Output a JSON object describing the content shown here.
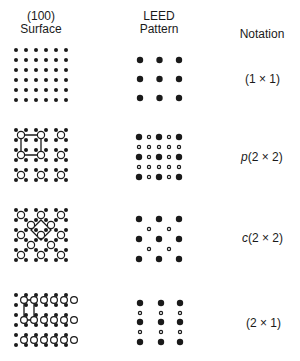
{
  "headers": {
    "surface": {
      "line1": "(100)",
      "line2": "Surface"
    },
    "leed": {
      "line1": "LEED",
      "line2": "Pattern"
    },
    "notation": "Notation"
  },
  "rows": [
    {
      "id": "1x1",
      "prefix": "",
      "notation": "(1 × 1)"
    },
    {
      "id": "p2x2",
      "prefix": "p",
      "notation": "(2 × 2)"
    },
    {
      "id": "c2x2",
      "prefix": "c",
      "notation": "(2 × 2)"
    },
    {
      "id": "2x1",
      "prefix": "",
      "notation": "(2 × 1)"
    }
  ],
  "colors": {
    "ink": "#1a1a1a",
    "background": "#ffffff"
  }
}
